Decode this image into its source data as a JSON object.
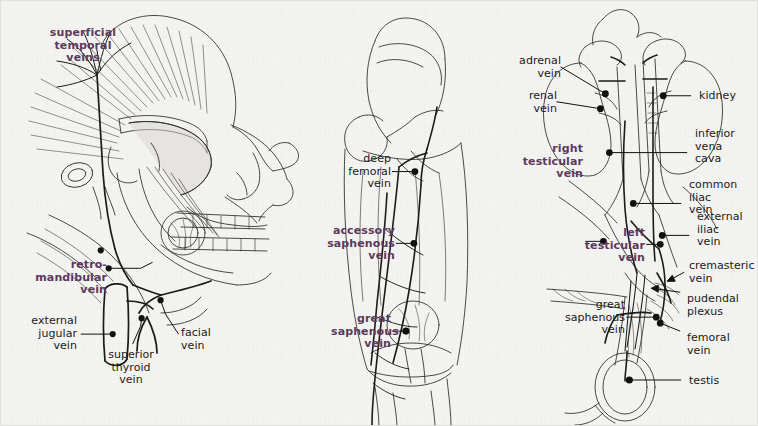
{
  "plate": {
    "title": "Venous anatomy plate",
    "background_color": "#f3f3f1",
    "key_label_color": "#5d3a5b",
    "plain_label_color": "#1a1a1a",
    "panels": [
      {
        "name": "head-and-neck",
        "subject": "lateral view of skull, face and neck veins"
      },
      {
        "name": "lower-limb",
        "subject": "anterior view of thigh and knee veins"
      },
      {
        "name": "abdomen-and-scrotum",
        "subject": "kidneys, inferior vena cava and testicular veins"
      }
    ]
  },
  "panel_head": {
    "labels": [
      {
        "id": "superficial-temporal-veins",
        "text": "superficial\ntemporal\nveins",
        "emphasis": "key",
        "align": "center"
      },
      {
        "id": "retromandibular-vein",
        "text": "retro-\nmandibular\nvein",
        "emphasis": "key",
        "align": "right"
      },
      {
        "id": "external-jugular-vein",
        "text": "external\njugular\nvein",
        "emphasis": "plain",
        "align": "right"
      },
      {
        "id": "superior-thyroid-vein",
        "text": "superior\nthyroid\nvein",
        "emphasis": "plain",
        "align": "center"
      },
      {
        "id": "facial-vein",
        "text": "facial\nvein",
        "emphasis": "plain",
        "align": "left"
      }
    ]
  },
  "panel_leg": {
    "labels": [
      {
        "id": "deep-femoral-vein",
        "text": "deep\nfemoral\nvein",
        "emphasis": "plain",
        "align": "right"
      },
      {
        "id": "accessory-saphenous-vein",
        "text": "accessory\nsaphenous\nvein",
        "emphasis": "key",
        "align": "right"
      },
      {
        "id": "great-saphenous-vein",
        "text": "great\nsaphenous\nvein",
        "emphasis": "key",
        "align": "right"
      }
    ]
  },
  "panel_pelvis": {
    "labels": [
      {
        "id": "adrenal-vein",
        "text": "adrenal\nvein",
        "emphasis": "plain",
        "align": "right"
      },
      {
        "id": "renal-vein",
        "text": "renal\nvein",
        "emphasis": "plain",
        "align": "right"
      },
      {
        "id": "kidney",
        "text": "kidney",
        "emphasis": "plain",
        "align": "left"
      },
      {
        "id": "inferior-vena-cava",
        "text": "inferior\nvena\ncava",
        "emphasis": "plain",
        "align": "left"
      },
      {
        "id": "right-testicular-vein",
        "text": "right\ntesticular\nvein",
        "emphasis": "key",
        "align": "right"
      },
      {
        "id": "common-iliac-vein",
        "text": "common\niliac\nvein",
        "emphasis": "plain",
        "align": "left"
      },
      {
        "id": "external-iliac-vein",
        "text": "external\niliac\nvein",
        "emphasis": "plain",
        "align": "left"
      },
      {
        "id": "left-testicular-vein",
        "text": "left\ntesticular\nvein",
        "emphasis": "key",
        "align": "right"
      },
      {
        "id": "cremasteric-vein",
        "text": "cremasteric\nvein",
        "emphasis": "plain",
        "align": "left"
      },
      {
        "id": "pudendal-plexus",
        "text": "pudendal\nplexus",
        "emphasis": "plain",
        "align": "left"
      },
      {
        "id": "great-saphenous-vein-2",
        "text": "great\nsaphenous\nvein",
        "emphasis": "plain",
        "align": "right"
      },
      {
        "id": "femoral-vein",
        "text": "femoral\nvein",
        "emphasis": "plain",
        "align": "left"
      },
      {
        "id": "testis",
        "text": "testis",
        "emphasis": "plain",
        "align": "left"
      }
    ]
  }
}
